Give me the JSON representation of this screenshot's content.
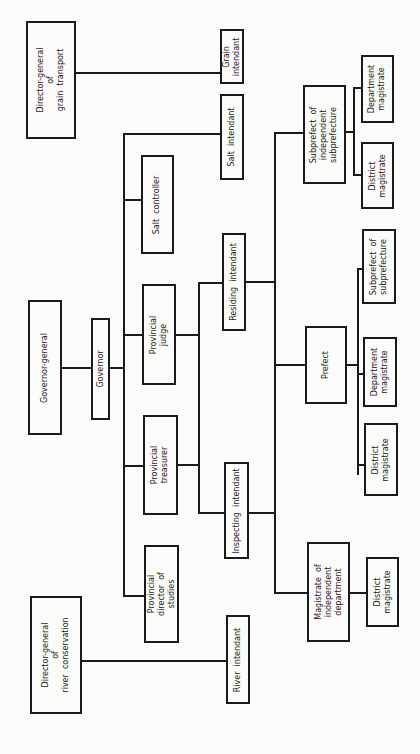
{
  "diagram": {
    "orientation": "rotated 90 degrees counter-clockwise",
    "nodes": {
      "dg_grain": "Director-general\nof\ngrain  transport",
      "grain_intendant": "Grain\nintendant",
      "salt_intendant": "Salt  intendant",
      "salt_controller": "Salt  controller",
      "governor_general": "Governor-general",
      "governor": "Governor",
      "provincial_judge": "Provincial\njudge",
      "residing_intendant": "Residing  intendant",
      "provincial_treasurer": "Provincial\ntreasurer",
      "inspecting_intendant": "Inspecting  intendant",
      "provincial_director": "Provincial\ndirector  of\nstudies",
      "dg_river": "Director-general\nof\nriver  conservation",
      "river_intendant": "River  intendant",
      "subprefect_indep": "Subprefect  of\nindependent\nsubprefecture",
      "sub_dept_magistrate": "Department\nmagistrate",
      "sub_district_magistrate": "District\nmagistrate",
      "prefect": "Prefect",
      "pref_subprefect": "Subprefect  of\nsubprefecture",
      "pref_dept_magistrate": "Department\nmagistrate",
      "pref_district_magistrate": "District\nmagistrate",
      "magistrate_indep": "Magistrate  of\nindependent\ndepartment",
      "mag_district_magistrate": "District\nmagistrate"
    }
  }
}
